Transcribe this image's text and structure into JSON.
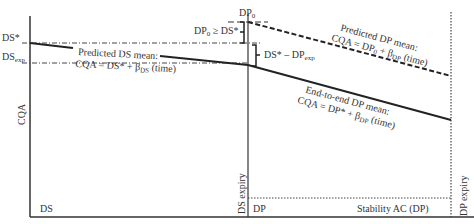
{
  "diagram": {
    "y_axis_label": "CQA",
    "regions": {
      "ds": "DS",
      "dp": "DP",
      "stability": "Stability AC (DP)"
    },
    "vertical_labels": {
      "ds_expiry": "DS expiry",
      "dp_expiry": "DP expiry"
    },
    "level_labels": {
      "ds_star": "DS*",
      "ds_exp_main": "DS",
      "ds_exp_sub": "exp",
      "dp0_main": "DP",
      "dp0_sub": "0"
    },
    "brackets": {
      "dp0_ge_ds": {
        "a": "DP",
        "a_sub": "0",
        "b": " ≥ DS*"
      },
      "ds_minus_dp": {
        "a": "DS* – DP",
        "a_sub": "exp"
      }
    },
    "annotations": {
      "predicted_ds": {
        "line1": "Predicted DS mean:",
        "line2a": "CQA = DS* + β",
        "line2sub": "DS",
        "line2b": " (time)"
      },
      "predicted_dp": {
        "line1": "Predicted DP mean:",
        "line2a": "CQA = DP",
        "line2sub0": "0",
        "line2mid": " + β",
        "line2sub": "DP",
        "line2b": " (time)"
      },
      "end_to_end_dp": {
        "line1": "End-to-end DP mean:",
        "line2a": "CQA = DP* + β",
        "line2sub": "DP",
        "line2b": " (time)"
      }
    }
  }
}
